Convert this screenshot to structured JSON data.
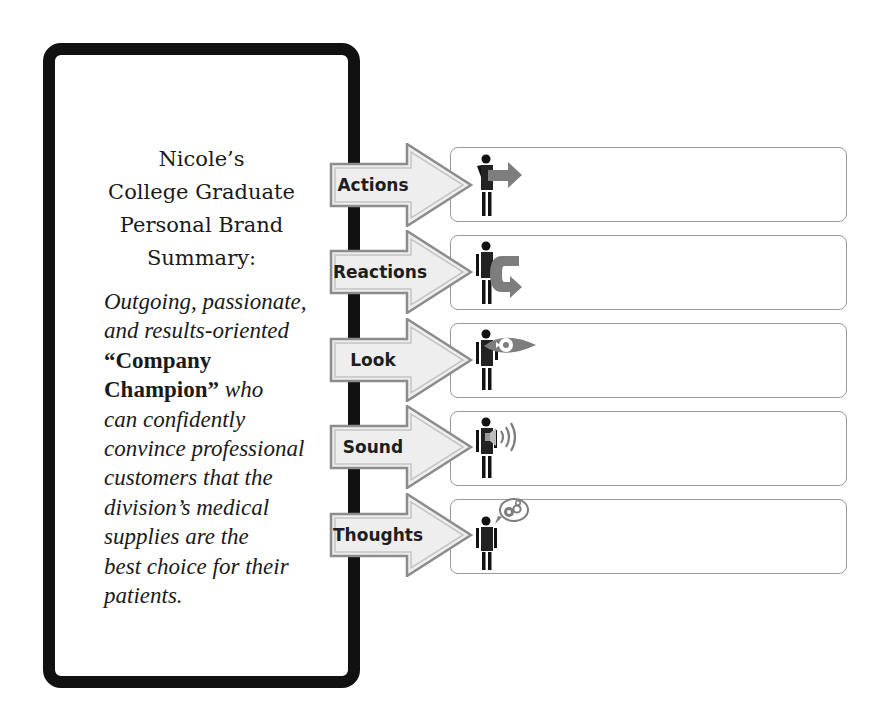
{
  "panel": {
    "title_lines": [
      "Nicole’s",
      "College Graduate",
      "Personal Brand",
      "Summary:"
    ],
    "body": {
      "l1": "Outgoing, passionate,",
      "l2": "and results-oriented",
      "l3_bold": "“Company",
      "l4_bold": "Champion”",
      "l4_italic": " who",
      "l5": "can confidently",
      "l6": "convince professional",
      "l7": "customers that the",
      "l8": "division’s medical",
      "l9": "supplies are the",
      "l10": "best choice for their",
      "l11": "patients."
    }
  },
  "rows": [
    {
      "label": "Actions",
      "icon": "person-pointing-arrow-icon",
      "content": ""
    },
    {
      "label": "Reactions",
      "icon": "person-return-arrow-icon",
      "content": ""
    },
    {
      "label": "Look",
      "icon": "person-eye-icon",
      "content": ""
    },
    {
      "label": "Sound",
      "icon": "person-speaker-icon",
      "content": ""
    },
    {
      "label": "Thoughts",
      "icon": "person-thought-gears-icon",
      "content": ""
    }
  ],
  "colors": {
    "panel_border": "#111111",
    "arrow_fill": "#eeeeee",
    "arrow_stroke": "#8c8c8c",
    "icon_gray": "#7d7d7d",
    "box_border": "#9a9a9a"
  }
}
